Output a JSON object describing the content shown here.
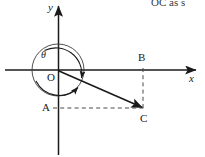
{
  "figure": {
    "kind": "coordinate-plane-angle-diagram",
    "width": 205,
    "height": 157,
    "background_color": "#ffffff",
    "stroke_color": "#1a1a1a",
    "axis_labels": {
      "y": "y",
      "x": "x"
    },
    "origin_label": "O",
    "angle_label": "θ",
    "points": [
      {
        "name": "A",
        "label": "A",
        "x": 48,
        "y": 108,
        "label_x": 42,
        "label_y": 102
      },
      {
        "name": "B",
        "label": "B",
        "x": 143,
        "y": 70,
        "label_x": 138,
        "label_y": 52
      },
      {
        "name": "C",
        "label": "C",
        "x": 143,
        "y": 108,
        "label_x": 140,
        "label_y": 113
      }
    ],
    "circle": {
      "center_x": 58,
      "center_y": 70,
      "radius": 26,
      "note": "unit circle centered at origin with rotation arrows"
    },
    "vector": {
      "from": "O",
      "to": "C",
      "label": "OC"
    },
    "dashed_segments": [
      {
        "name": "B-to-C vertical",
        "from": "B",
        "to": "C"
      },
      {
        "name": "A-to-C horizontal",
        "from": "A",
        "to": "C"
      }
    ],
    "arc_arrow_count": 2,
    "top_clipped_text": "OC  as s"
  }
}
